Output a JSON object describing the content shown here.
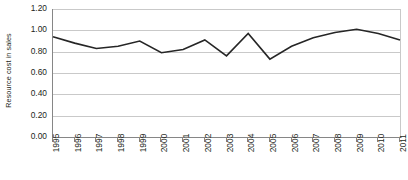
{
  "chart_data": {
    "type": "line",
    "title": "",
    "subtitle": "",
    "xlabel": "",
    "ylabel": "Resource cost in sales",
    "ylim": [
      0.0,
      1.2
    ],
    "ytick_labels": [
      "1.20",
      "1.00",
      "0.80",
      "0.60",
      "0.40",
      "0.20",
      "0.00"
    ],
    "ytick_values": [
      1.2,
      1.0,
      0.8,
      0.6,
      0.4,
      0.2,
      0.0
    ],
    "grid": true,
    "legend": "none",
    "categories": [
      "1995",
      "1996",
      "1997",
      "1998",
      "1999",
      "2000",
      "2001",
      "2002",
      "2003",
      "2004",
      "2005",
      "2006",
      "2007",
      "2008",
      "2009",
      "2010",
      "2011"
    ],
    "values": [
      0.94,
      0.88,
      0.83,
      0.85,
      0.9,
      0.79,
      0.82,
      0.91,
      0.76,
      0.97,
      0.73,
      0.85,
      0.93,
      0.98,
      1.01,
      0.97,
      0.91
    ],
    "series": [
      {
        "name": "Resource cost in sales",
        "values": [
          0.94,
          0.88,
          0.83,
          0.85,
          0.9,
          0.79,
          0.82,
          0.91,
          0.76,
          0.97,
          0.73,
          0.85,
          0.93,
          0.98,
          1.01,
          0.97,
          0.91
        ],
        "color": "#262626"
      }
    ],
    "colors": {
      "series_line": "#262626",
      "gridline": "#c9c9c9",
      "axis": "#868686",
      "text": "#231f20",
      "background": "#ffffff"
    }
  }
}
